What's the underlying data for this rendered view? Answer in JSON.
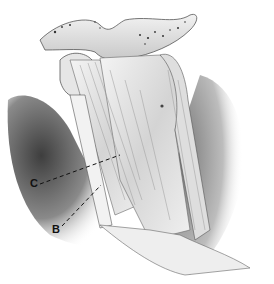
{
  "figure": {
    "type": "anatomical-illustration",
    "style": "grayscale pencil drawing",
    "labels": [
      {
        "id": "C",
        "text": "C",
        "x": 30,
        "y": 178,
        "leader_to": [
          120,
          155
        ]
      },
      {
        "id": "B",
        "text": "B",
        "x": 52,
        "y": 224,
        "leader_to": [
          101,
          185
        ]
      }
    ],
    "colors": {
      "background": "#ffffff",
      "shadow_dark": "#4a4a4a",
      "shadow_mid": "#8c8c8c",
      "ligament_light": "#e8e8e8",
      "outline": "#333333",
      "label": "#111111"
    }
  }
}
